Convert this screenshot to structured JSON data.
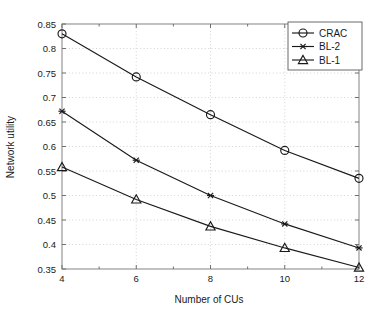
{
  "chart_data": {
    "type": "line",
    "title": "",
    "xlabel": "Number of CUs",
    "ylabel": "Network utility",
    "x": [
      4,
      6,
      8,
      10,
      12
    ],
    "xlim": [
      4,
      12
    ],
    "ylim": [
      0.35,
      0.85
    ],
    "xticks": [
      "4",
      "6",
      "8",
      "10",
      "12"
    ],
    "yticks": [
      "0.35",
      "0.4",
      "0.45",
      "0.5",
      "0.55",
      "0.6",
      "0.65",
      "0.7",
      "0.75",
      "0.8",
      "0.85"
    ],
    "ytick_values": [
      0.35,
      0.4,
      0.45,
      0.5,
      0.55,
      0.6,
      0.65,
      0.7,
      0.75,
      0.8,
      0.85
    ],
    "grid": true,
    "legend_position": "top-right",
    "series": [
      {
        "name": "CRAC",
        "marker": "circle-marker",
        "values": [
          0.83,
          0.742,
          0.665,
          0.592,
          0.535
        ]
      },
      {
        "name": "BL-2",
        "marker": "asterisk-marker",
        "values": [
          0.672,
          0.572,
          0.5,
          0.442,
          0.393
        ]
      },
      {
        "name": "BL-1",
        "marker": "triangle-marker",
        "values": [
          0.558,
          0.492,
          0.437,
          0.393,
          0.353
        ]
      }
    ],
    "colors": {
      "line": "#1a1a1a",
      "grid": "#c9c9c9",
      "axis": "#8e8e8e",
      "background": "#ffffff"
    }
  }
}
